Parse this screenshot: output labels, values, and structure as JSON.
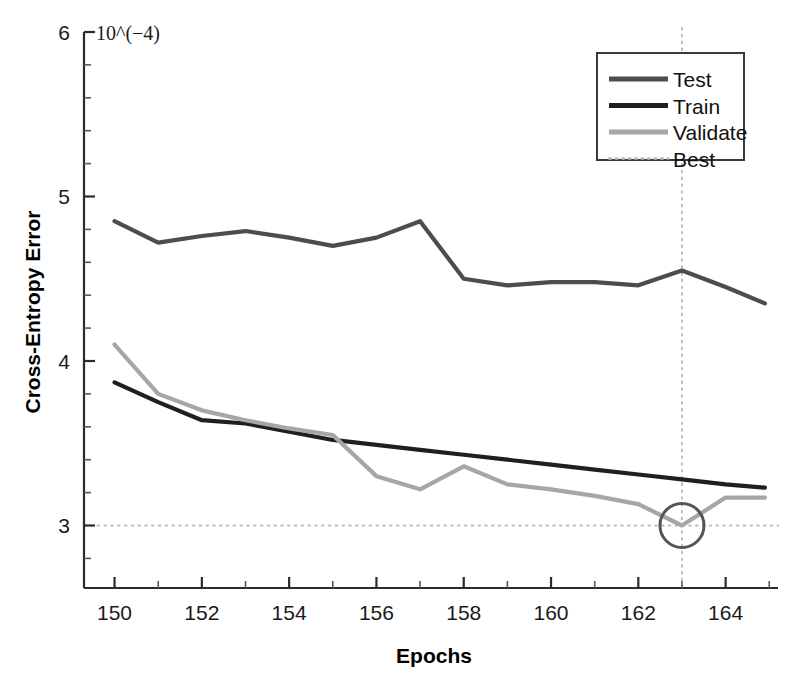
{
  "chart_data": {
    "type": "line",
    "title": "",
    "xlabel": "Epochs",
    "ylabel": "Cross-Entropy Error",
    "y_exponent_label": "10^(−4)",
    "xlim": [
      149.3,
      165.2
    ],
    "ylim": [
      2.62,
      6.0
    ],
    "xticks": [
      150,
      152,
      154,
      156,
      158,
      160,
      162,
      164
    ],
    "xticklabels": [
      "150",
      "152",
      "154",
      "156",
      "158",
      "160",
      "162",
      "164"
    ],
    "yticks": [
      3,
      4,
      5,
      6
    ],
    "yticklabels": [
      "3",
      "4",
      "5",
      "6"
    ],
    "yminorticks": [
      3.2,
      3.4,
      3.6,
      3.8,
      4.2,
      4.4,
      4.6,
      4.8,
      5.2,
      5.4,
      5.6,
      5.8,
      2.8
    ],
    "xminorticks": [
      151,
      153,
      155,
      157,
      159,
      161,
      163,
      165
    ],
    "grid": false,
    "legend_position": "upper right",
    "x": [
      150,
      151,
      152,
      153,
      154,
      155,
      156,
      157,
      158,
      159,
      160,
      161,
      162,
      163,
      164,
      164.9
    ],
    "series": [
      {
        "name": "Test",
        "color": "#4d4d4d",
        "values": [
          4.85,
          4.72,
          4.76,
          4.79,
          4.75,
          4.7,
          4.75,
          4.85,
          4.5,
          4.46,
          4.48,
          4.48,
          4.46,
          4.55,
          4.45,
          4.35
        ]
      },
      {
        "name": "Train",
        "color": "#1f1f1f",
        "values": [
          3.87,
          3.75,
          3.64,
          3.62,
          3.57,
          3.52,
          3.49,
          3.46,
          3.43,
          3.4,
          3.37,
          3.34,
          3.31,
          3.28,
          3.25,
          3.23
        ]
      },
      {
        "name": "Validate",
        "color": "#a6a6a6",
        "values": [
          4.1,
          3.8,
          3.7,
          3.64,
          3.59,
          3.55,
          3.3,
          3.22,
          3.36,
          3.25,
          3.22,
          3.18,
          3.13,
          3.0,
          3.17,
          3.17
        ]
      }
    ],
    "best": {
      "name": "Best",
      "color": "#bdbdbd",
      "epoch": 163,
      "value": 3.0,
      "marker": "circle",
      "marker_color": "#555555",
      "vline": true,
      "hline": true
    },
    "legend_entries": [
      {
        "label": "Test",
        "color": "#4d4d4d",
        "style": "solid"
      },
      {
        "label": "Train",
        "color": "#1f1f1f",
        "style": "solid"
      },
      {
        "label": "Validate",
        "color": "#a6a6a6",
        "style": "solid"
      },
      {
        "label": "Best",
        "color": "#bdbdbd",
        "style": "dotted"
      }
    ]
  }
}
